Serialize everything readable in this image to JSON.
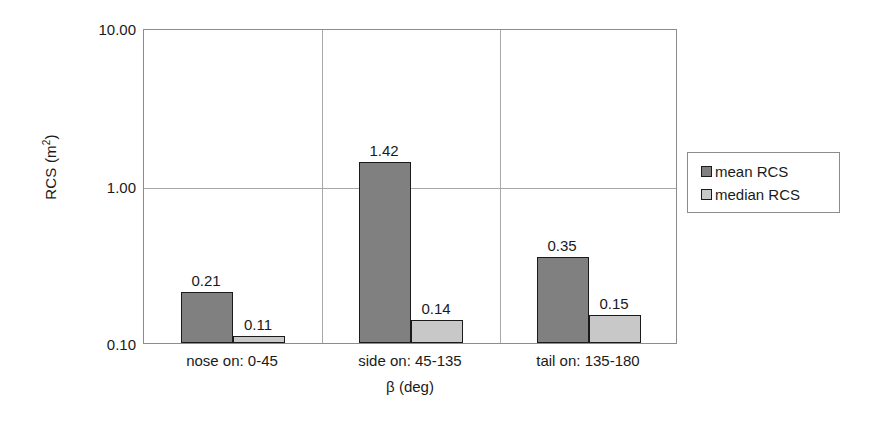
{
  "chart_data": {
    "type": "bar",
    "title": "",
    "xlabel": "β (deg)",
    "ylabel": "RCS (m²)",
    "yscale": "log",
    "ylim": [
      0.1,
      10.0
    ],
    "ytick_labels": [
      "10.00",
      "1.00",
      "0.10"
    ],
    "ytick_values": [
      10.0,
      1.0,
      0.1
    ],
    "grid": "horizontal-and-category-separators",
    "legend_position": "right",
    "categories": [
      "nose on:  0-45",
      "side on: 45-135",
      "tail on: 135-180"
    ],
    "series": [
      {
        "name": "mean RCS",
        "color": "#808080",
        "values": [
          0.21,
          1.42,
          0.35
        ],
        "value_labels": [
          "0.21",
          "1.42",
          "0.35"
        ]
      },
      {
        "name": "median RCS",
        "color": "#c8c8c8",
        "values": [
          0.11,
          0.14,
          0.15
        ],
        "value_labels": [
          "0.11",
          "0.14",
          "0.15"
        ]
      }
    ]
  },
  "legend": {
    "entries": [
      {
        "label": "mean RCS",
        "color": "#808080"
      },
      {
        "label": "median RCS",
        "color": "#c8c8c8"
      }
    ]
  },
  "axis": {
    "y_title": "RCS (m",
    "y_title_sup": "2",
    "y_title_close": ")",
    "x_title": "β (deg)"
  },
  "colors": {
    "mean_bar": "#808080",
    "median_bar": "#c8c8c8",
    "bar_outline": "#1a1a1a",
    "gridline": "#a8a8a8",
    "plot_border": "#8c8c8c",
    "text": "#1a1a1a",
    "background": "#ffffff"
  }
}
